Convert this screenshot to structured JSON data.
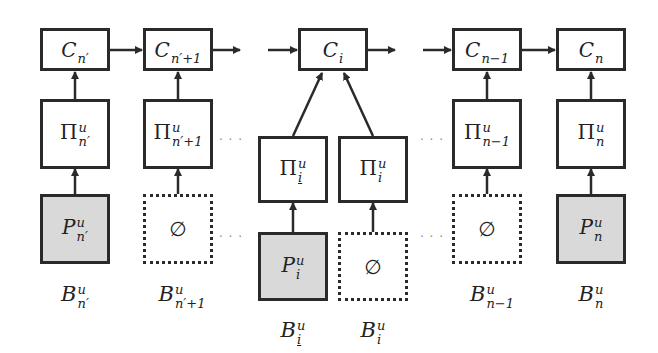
{
  "diagram": {
    "type": "block-flow",
    "colors": {
      "stroke": "#2a2a2a",
      "shaded_fill": "#d9d9d9",
      "ellipsis": "#888888"
    },
    "ellipsis": "· · ·",
    "columns": [
      {
        "id": "n_prime",
        "c": {
          "base": "C",
          "sub": "n′"
        },
        "pi": {
          "base": "Π",
          "sup": "u",
          "sub": "n′"
        },
        "bottom": {
          "kind": "shaded",
          "base": "P",
          "sup": "u",
          "sub": "n′"
        },
        "label": {
          "base": "B",
          "sup": "u",
          "sub": "n′"
        }
      },
      {
        "id": "n_prime_plus_1",
        "c": {
          "base": "C",
          "sub": "n′+1"
        },
        "pi": {
          "base": "Π",
          "sup": "u",
          "sub": "n′+1"
        },
        "bottom": {
          "kind": "empty",
          "text": "∅"
        },
        "label": {
          "base": "B",
          "sup": "u",
          "sub": "n′+1"
        }
      },
      {
        "id": "i_underline",
        "pi": {
          "base": "Π",
          "sup": "u",
          "sub": "i"
        },
        "bottom": {
          "kind": "shaded",
          "base": "P",
          "sup": "u",
          "sub": "i"
        },
        "label": {
          "base": "B",
          "sup": "u",
          "sub": "i"
        }
      },
      {
        "id": "i",
        "pi": {
          "base": "Π",
          "sup": "u",
          "sub": "i"
        },
        "bottom": {
          "kind": "empty",
          "text": "∅"
        },
        "label": {
          "base": "B",
          "sup": "u",
          "sub": "i"
        }
      },
      {
        "id": "n_minus_1",
        "c": {
          "base": "C",
          "sub": "n−1"
        },
        "pi": {
          "base": "Π",
          "sup": "u",
          "sub": "n−1"
        },
        "bottom": {
          "kind": "empty",
          "text": "∅"
        },
        "label": {
          "base": "B",
          "sup": "u",
          "sub": "n−1"
        }
      },
      {
        "id": "n",
        "c": {
          "base": "C",
          "sub": "n"
        },
        "pi": {
          "base": "Π",
          "sup": "u",
          "sub": "n"
        },
        "bottom": {
          "kind": "shaded",
          "base": "P",
          "sup": "u",
          "sub": "n"
        },
        "label": {
          "base": "B",
          "sup": "u",
          "sub": "n"
        }
      }
    ],
    "center_c": {
      "base": "C",
      "sub": "i"
    }
  }
}
